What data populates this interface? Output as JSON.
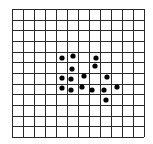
{
  "grid": {
    "left": 12,
    "top": 9,
    "width": 132,
    "height": 128,
    "columns": 12,
    "rows": 12,
    "line_color": "#2a2a2a",
    "background": "#ffffff"
  },
  "dots": {
    "color": "#000000",
    "radius": 2.6,
    "points": [
      {
        "x": 62,
        "y": 58
      },
      {
        "x": 73,
        "y": 56
      },
      {
        "x": 96,
        "y": 58
      },
      {
        "x": 95,
        "y": 66
      },
      {
        "x": 72,
        "y": 69
      },
      {
        "x": 84,
        "y": 76
      },
      {
        "x": 107,
        "y": 77
      },
      {
        "x": 62,
        "y": 78
      },
      {
        "x": 71,
        "y": 79
      },
      {
        "x": 62,
        "y": 88
      },
      {
        "x": 71,
        "y": 90
      },
      {
        "x": 82,
        "y": 87
      },
      {
        "x": 92,
        "y": 90
      },
      {
        "x": 104,
        "y": 90
      },
      {
        "x": 117,
        "y": 87
      },
      {
        "x": 106,
        "y": 100
      }
    ]
  }
}
